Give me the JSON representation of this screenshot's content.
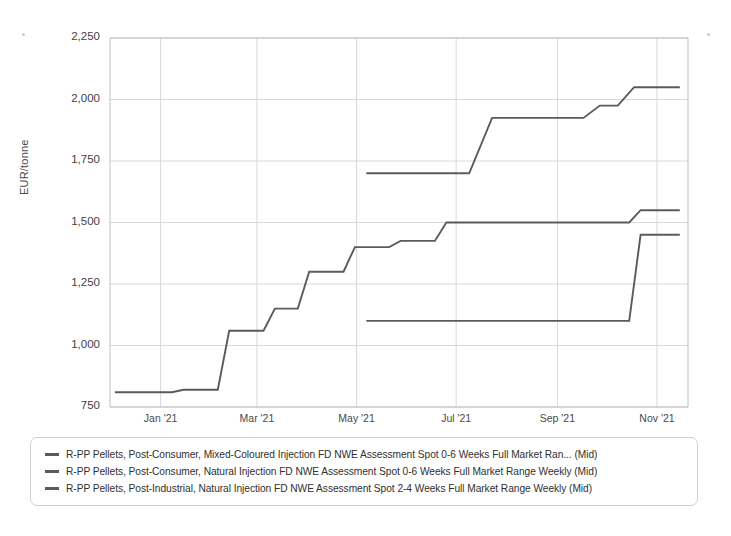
{
  "chart_data": {
    "type": "line",
    "title": "",
    "subtitle": "",
    "xlabel": "",
    "ylabel": "EUR/tonne",
    "ylim": [
      750,
      2250
    ],
    "ytick_labels": [
      "2,250",
      "2,000",
      "1,750",
      "1,500",
      "1,250",
      "1,000",
      "750"
    ],
    "ytick_values": [
      2250,
      2000,
      1750,
      1500,
      1250,
      1000,
      750
    ],
    "xtick_labels": [
      "Jan '21",
      "Mar '21",
      "May '21",
      "Jul '21",
      "Sep '21",
      "Nov '21"
    ],
    "xtick_values": [
      "2021-01",
      "2021-03",
      "2021-05",
      "2021-07",
      "2021-09",
      "2021-11"
    ],
    "xlim": [
      "2020-12-01",
      "2021-11-20"
    ],
    "grid": true,
    "legend_position": "below-plot",
    "line_color": "#5b5b5b",
    "grid_color": "#d8d8d8",
    "axis_color": "#bfbfbf",
    "step_style": "linear-steps",
    "series": [
      {
        "name": "R-PP Pellets, Post-Consumer, Mixed-Coloured Injection FD NWE Assessment Spot 0-6 Weeks Full Market Ran... (Mid)",
        "color": "#5b5b5b",
        "points": [
          {
            "x": "2021-05-07",
            "y": 1700
          },
          {
            "x": "2021-07-09",
            "y": 1700
          },
          {
            "x": "2021-07-23",
            "y": 1925
          },
          {
            "x": "2021-09-17",
            "y": 1925
          },
          {
            "x": "2021-09-27",
            "y": 1975
          },
          {
            "x": "2021-10-08",
            "y": 1975
          },
          {
            "x": "2021-10-18",
            "y": 2050
          },
          {
            "x": "2021-11-15",
            "y": 2050
          }
        ]
      },
      {
        "name": "R-PP Pellets, Post-Consumer, Natural Injection FD NWE Assessment Spot 0-6 Weeks Full Market Range Weekly (Mid)",
        "color": "#5b5b5b",
        "points": [
          {
            "x": "2020-12-04",
            "y": 810
          },
          {
            "x": "2021-01-08",
            "y": 810
          },
          {
            "x": "2021-01-15",
            "y": 820
          },
          {
            "x": "2021-02-05",
            "y": 820
          },
          {
            "x": "2021-02-12",
            "y": 1060
          },
          {
            "x": "2021-03-05",
            "y": 1060
          },
          {
            "x": "2021-03-12",
            "y": 1150
          },
          {
            "x": "2021-03-26",
            "y": 1150
          },
          {
            "x": "2021-04-02",
            "y": 1300
          },
          {
            "x": "2021-04-23",
            "y": 1300
          },
          {
            "x": "2021-04-30",
            "y": 1400
          },
          {
            "x": "2021-05-21",
            "y": 1400
          },
          {
            "x": "2021-05-28",
            "y": 1425
          },
          {
            "x": "2021-06-18",
            "y": 1425
          },
          {
            "x": "2021-06-25",
            "y": 1500
          },
          {
            "x": "2021-10-15",
            "y": 1500
          },
          {
            "x": "2021-10-22",
            "y": 1550
          },
          {
            "x": "2021-11-15",
            "y": 1550
          }
        ]
      },
      {
        "name": "R-PP Pellets, Post-Industrial, Natural Injection FD NWE Assessment Spot 2-4 Weeks Full Market Range Weekly (Mid)",
        "color": "#5b5b5b",
        "points": [
          {
            "x": "2021-05-07",
            "y": 1100
          },
          {
            "x": "2021-10-15",
            "y": 1100
          },
          {
            "x": "2021-10-22",
            "y": 1450
          },
          {
            "x": "2021-11-15",
            "y": 1450
          }
        ]
      }
    ]
  },
  "legend": {
    "entries": [
      "R-PP Pellets, Post-Consumer, Mixed-Coloured Injection FD NWE Assessment Spot 0-6 Weeks Full Market Ran... (Mid)",
      "R-PP Pellets, Post-Consumer, Natural Injection FD NWE Assessment Spot 0-6 Weeks Full Market Range Weekly (Mid)",
      "R-PP Pellets, Post-Industrial, Natural Injection FD NWE Assessment Spot 2-4 Weeks Full Market Range Weekly (Mid)"
    ]
  }
}
